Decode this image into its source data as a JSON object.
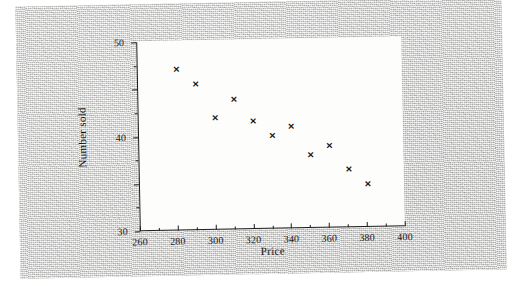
{
  "figure": {
    "title": "",
    "x_axis_title": "Price",
    "y_axis_title": "Number sold"
  },
  "chart_data": {
    "type": "scatter",
    "title": "",
    "xlabel": "Price",
    "ylabel": "Number sold",
    "xlim": [
      260,
      400
    ],
    "ylim": [
      10,
      50
    ],
    "grid": false,
    "legend": null,
    "marker": "x",
    "marker_color": "#141414",
    "x_ticks": [
      260,
      280,
      300,
      320,
      340,
      360,
      380,
      400
    ],
    "x_tick_labels": [
      "260",
      "280",
      "300",
      "320",
      "340",
      "360",
      "380",
      "400"
    ],
    "x_minor_ticks": [
      270,
      290,
      310,
      330,
      350,
      370,
      390
    ],
    "y_ticks": [
      10,
      20,
      30,
      40,
      50
    ],
    "y_tick_labels": [
      "10",
      "20",
      "30",
      "40",
      "50"
    ],
    "y_minor_ticks": [
      15,
      25,
      35,
      45
    ],
    "x": [
      281,
      291,
      301,
      311,
      321,
      331,
      341,
      351,
      361,
      371,
      381
    ],
    "y": [
      44,
      41,
      33.7,
      37.5,
      32.8,
      29.6,
      31.6,
      25.5,
      27.3,
      22.3,
      19
    ],
    "points": [
      {
        "x": 281,
        "y": 44
      },
      {
        "x": 291,
        "y": 41
      },
      {
        "x": 301,
        "y": 33.7
      },
      {
        "x": 311,
        "y": 37.5
      },
      {
        "x": 321,
        "y": 32.8
      },
      {
        "x": 331,
        "y": 29.6
      },
      {
        "x": 341,
        "y": 31.6
      },
      {
        "x": 351,
        "y": 25.5
      },
      {
        "x": 361,
        "y": 27.3
      },
      {
        "x": 371,
        "y": 22.3
      },
      {
        "x": 381,
        "y": 19
      }
    ]
  }
}
